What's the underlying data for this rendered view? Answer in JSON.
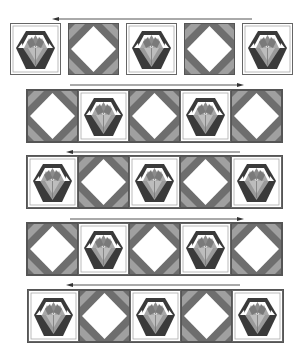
{
  "diagram": {
    "title": "",
    "colors": {
      "background": "#ffffff",
      "basket_dark": "#3a3a3a",
      "basket_mid": "#8a8a8a",
      "basket_light": "#b5b5b5",
      "frame_line": "#9a9a9a",
      "square_dark": "#6e6e6e",
      "square_light": "#a0a0a0",
      "arrow": "#555555"
    },
    "rows": [
      {
        "index": 1,
        "pressing_direction": "left",
        "blocks": [
          "basket",
          "square-in-square",
          "basket",
          "square-in-square",
          "basket"
        ],
        "joined": false
      },
      {
        "index": 2,
        "pressing_direction": "right",
        "blocks": [
          "square-in-square",
          "basket",
          "square-in-square",
          "basket",
          "square-in-square"
        ],
        "joined": true
      },
      {
        "index": 3,
        "pressing_direction": "left",
        "blocks": [
          "basket",
          "square-in-square",
          "basket",
          "square-in-square",
          "basket"
        ],
        "joined": true
      },
      {
        "index": 4,
        "pressing_direction": "right",
        "blocks": [
          "square-in-square",
          "basket",
          "square-in-square",
          "basket",
          "square-in-square"
        ],
        "joined": true
      },
      {
        "index": 5,
        "pressing_direction": "left",
        "blocks": [
          "basket",
          "square-in-square",
          "basket",
          "square-in-square",
          "basket"
        ],
        "joined": true
      }
    ]
  }
}
